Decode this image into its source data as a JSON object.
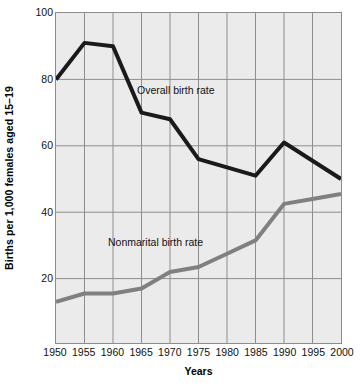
{
  "chart_data": {
    "type": "line",
    "title": "",
    "xlabel": "Years",
    "ylabel": "Births per 1,000 females aged 15–19",
    "x": [
      1950,
      1955,
      1960,
      1965,
      1970,
      1975,
      1980,
      1985,
      1990,
      1995,
      2000
    ],
    "xtick_labels": [
      "1950",
      "1955",
      "1960",
      "1965",
      "1970",
      "1975",
      "1980",
      "1985",
      "1990",
      "1995",
      "2000"
    ],
    "ytick_labels": [
      "100",
      "80",
      "60",
      "40",
      "20"
    ],
    "ytick_values": [
      100,
      80,
      60,
      40,
      20
    ],
    "xlim": [
      1950,
      2000
    ],
    "ylim": [
      0,
      100
    ],
    "grid": true,
    "legend_position": "inline-annotations",
    "series": [
      {
        "name": "Overall birth rate",
        "color": "#1a1a1a",
        "label_text": "Overall birth rate",
        "values": [
          80,
          91,
          90,
          70,
          68,
          56,
          53.5,
          51,
          61,
          55.5,
          50
        ]
      },
      {
        "name": "Nonmarital birth rate",
        "color": "#808080",
        "label_text": "Nonmarital birth rate",
        "values": [
          13,
          15.5,
          15.5,
          17,
          22,
          23.5,
          27.5,
          31.5,
          42.5,
          44,
          45.5
        ]
      }
    ],
    "annotations": [
      {
        "text": "Overall birth rate",
        "x": 1966,
        "y": 76
      },
      {
        "text": "Nonmarital birth rate",
        "x": 1961,
        "y": 31
      }
    ],
    "colors": {
      "plot_background": "#ebebeb",
      "grid": "#8d8d8d",
      "frame": "#8d8d8d",
      "overall_series": "#1a1a1a",
      "nonmarital_series": "#808080"
    }
  }
}
